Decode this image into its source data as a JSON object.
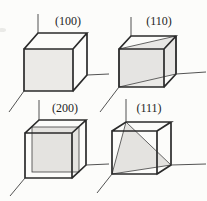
{
  "figure": {
    "cubes": [
      {
        "id": "100",
        "label": "(100)"
      },
      {
        "id": "110",
        "label": "(110)"
      },
      {
        "id": "200",
        "label": "(200)"
      },
      {
        "id": "111",
        "label": "(111)"
      }
    ]
  },
  "colors": {
    "line": "#2b2b2b",
    "axis": "#3f3f3f",
    "face": "#ebeae7",
    "plane": "#e4e3e0",
    "label": "#1e1e1e",
    "background": "#fcfcfa"
  }
}
